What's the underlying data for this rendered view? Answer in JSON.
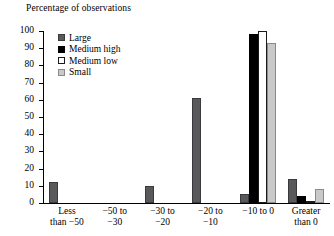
{
  "chart_data": {
    "type": "bar",
    "title": "",
    "ylabel": "Percentage of observations",
    "xlabel": "",
    "ylim": [
      0,
      100
    ],
    "yticks": [
      0,
      10,
      20,
      30,
      40,
      50,
      60,
      70,
      80,
      90,
      100
    ],
    "grid": false,
    "legend_position": "top-left-inside",
    "categories": [
      "Less than −50",
      "−50 to −30",
      "−30 to −20",
      "−20 to −10",
      "−10 to 0",
      "Greater than 0"
    ],
    "category_lines": [
      [
        "Less",
        "than −50"
      ],
      [
        "−50 to",
        "−30"
      ],
      [
        "−30 to",
        "−20"
      ],
      [
        "−20 to",
        "−10"
      ],
      [
        "−10 to 0",
        ""
      ],
      [
        "Greater",
        "than 0"
      ]
    ],
    "series": [
      {
        "name": "Large",
        "color": "#59595b",
        "values": [
          12,
          0,
          10,
          61,
          5,
          14
        ]
      },
      {
        "name": "Medium high",
        "color": "#000000",
        "values": [
          0,
          0,
          0,
          0,
          98,
          4
        ]
      },
      {
        "name": "Medium low",
        "color": "#ffffff",
        "values": [
          0,
          0,
          0,
          0,
          100,
          1
        ]
      },
      {
        "name": "Small",
        "color": "#c9c9c9",
        "values": [
          0,
          0,
          0,
          0,
          93,
          8
        ]
      }
    ]
  },
  "legend": {
    "items": [
      {
        "label": "Large"
      },
      {
        "label": "Medium high"
      },
      {
        "label": "Medium low"
      },
      {
        "label": "Small"
      }
    ]
  },
  "axis": {
    "y_tick_labels": [
      "100",
      "90",
      "80",
      "70",
      "60",
      "50",
      "40",
      "30",
      "20",
      "10",
      "0"
    ]
  }
}
